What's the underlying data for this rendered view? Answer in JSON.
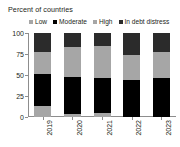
{
  "chart_data": {
    "type": "bar",
    "subtype": "stacked-bar-100",
    "title": "Percent of countries",
    "xlabel": "",
    "ylabel": "",
    "categories": [
      "2019",
      "2020",
      "2021",
      "2022",
      "2023"
    ],
    "ylim": [
      0,
      100
    ],
    "yticks": [
      0,
      25,
      50,
      75,
      100
    ],
    "ytick_labels": [
      "0",
      "25",
      "50",
      "75",
      "100"
    ],
    "grid": false,
    "legend_position": "top",
    "series": [
      {
        "name": "Low",
        "color": "#a6a6a6",
        "values": [
          13,
          3,
          5,
          0,
          0
        ]
      },
      {
        "name": "Moderate",
        "color": "#000000",
        "values": [
          38,
          45,
          41,
          44,
          46
        ]
      },
      {
        "name": "High",
        "color": "#a6a6a6",
        "values": [
          26,
          35,
          38,
          30,
          31
        ]
      },
      {
        "name": "In debt distress",
        "color": "#2b2b2b",
        "values": [
          23,
          17,
          16,
          26,
          23
        ]
      }
    ]
  },
  "legend": {
    "items": [
      {
        "label": "Low",
        "color": "#a6a6a6"
      },
      {
        "label": "Moderate",
        "color": "#000000"
      },
      {
        "label": "High",
        "color": "#a6a6a6"
      },
      {
        "label": "In debt distress",
        "color": "#2b2b2b"
      }
    ]
  },
  "colors": {
    "axis": "#8d8d8d",
    "text": "#231f20",
    "background": "#ffffff"
  }
}
